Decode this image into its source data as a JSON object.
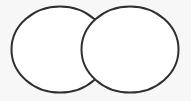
{
  "figure": {
    "name": "two-circle-venn-diagram",
    "width": 191,
    "height": 101,
    "background_color": "#f7f7f8",
    "stroke_color": "#2f2f33",
    "stroke_width": 2,
    "fill_color": "#ffffff",
    "title": "",
    "labels": {
      "left_set": "",
      "right_set": "",
      "intersection": ""
    }
  },
  "chart_data": {
    "type": "diagram",
    "subtype": "venn",
    "set_count": 2,
    "title": "",
    "sets": [
      {
        "name": "left-set",
        "label": "",
        "shape": "ellipse",
        "cx": 60,
        "cy": 49.5,
        "rx": 48.5,
        "ry": 43,
        "fill": "#ffffff",
        "stroke": "#2f2f33"
      },
      {
        "name": "right-set",
        "label": "",
        "shape": "ellipse",
        "cx": 130,
        "cy": 49.5,
        "rx": 48.5,
        "ry": 43,
        "fill": "#ffffff",
        "stroke": "#2f2f33"
      }
    ],
    "intersection": {
      "name": "lens-region",
      "label": "",
      "x_range": [
        81.5,
        108.5
      ],
      "y_range": [
        13,
        86
      ],
      "crossing_points": [
        {
          "x": 95,
          "y": 13
        },
        {
          "x": 95,
          "y": 86
        }
      ]
    },
    "axis_labels": {
      "x": "",
      "y": ""
    },
    "legend": [],
    "grid": false
  }
}
